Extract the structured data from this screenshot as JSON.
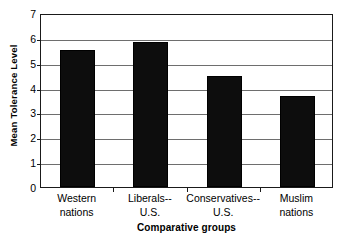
{
  "chart_data": {
    "type": "bar",
    "title": "",
    "subtitle": "",
    "xlabel": "Comparative groups",
    "ylabel": "Mean Tolerance Level",
    "categories": [
      "Western nations",
      "Liberals-- U.S.",
      "Conservatives-- U.S.",
      "Muslim nations"
    ],
    "category_lines": [
      [
        "Western",
        "nations"
      ],
      [
        "Liberals--",
        "U.S."
      ],
      [
        "Conservatives--",
        "U.S."
      ],
      [
        "Muslim",
        "nations"
      ]
    ],
    "values": [
      5.5,
      5.85,
      4.45,
      3.65
    ],
    "ylim": [
      0,
      7
    ],
    "ytick_labels": [
      "0",
      "1",
      "2",
      "3",
      "4",
      "5",
      "6",
      "7"
    ],
    "ytick_values": [
      0,
      1,
      2,
      3,
      4,
      5,
      6,
      7
    ],
    "grid": true,
    "grid_axis": "y",
    "legend": "none",
    "bar_color": "#0d0d0d",
    "grid_color": "#6e6e6e",
    "frame_color": "#1a1a1a",
    "background_color": "#ffffff"
  }
}
